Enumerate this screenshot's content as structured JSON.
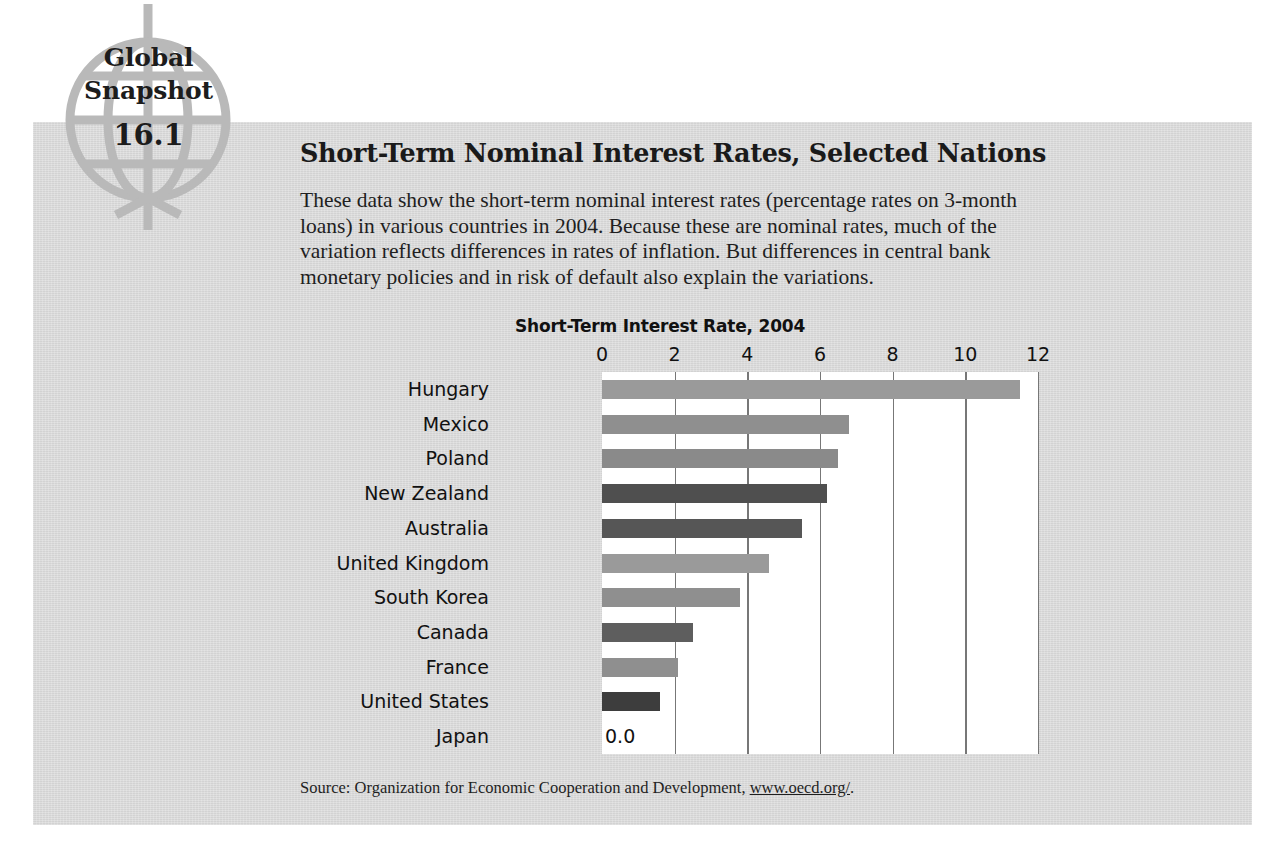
{
  "badge": {
    "line1": "Global",
    "line2": "Snapshot",
    "number": "16.1",
    "icon": "globe-icon"
  },
  "heading": "Short-Term Nominal Interest Rates, Selected Nations",
  "blurb": "These data show the short-term nominal interest rates (percentage rates on 3-month loans) in various countries in 2004. Because these are nominal rates, much of the variation reflects differences in rates of inflation. But differences in central bank monetary policies and in risk of default also explain the variations.",
  "source": {
    "prefix": "Source: Organization for Economic Cooperation and Development, ",
    "link": "www.oecd.org/",
    "suffix": "."
  },
  "colors": {
    "panel_bg": "#d7d7d7",
    "plot_bg": "#ffffff",
    "bar_light": "#9a9a9a",
    "bar_dark": "#4f4f4f",
    "gridline": "#777777",
    "text": "#1a1a1a"
  },
  "chart_data": {
    "type": "bar",
    "orientation": "horizontal",
    "title": "Short-Term Interest Rate, 2004",
    "xlabel": "",
    "ylabel": "",
    "xlim": [
      0,
      12
    ],
    "ticks": [
      "0",
      "2",
      "4",
      "6",
      "8",
      "10",
      "12"
    ],
    "tick_values": [
      0,
      2,
      4,
      6,
      8,
      10,
      12
    ],
    "grid": true,
    "legend": "none",
    "zero_annotation": "0.0",
    "categories": [
      "Hungary",
      "Mexico",
      "Poland",
      "New Zealand",
      "Australia",
      "United Kingdom",
      "South Korea",
      "Canada",
      "France",
      "United States",
      "Japan"
    ],
    "values": [
      11.5,
      6.8,
      6.5,
      6.2,
      5.5,
      4.6,
      3.8,
      2.5,
      2.1,
      1.6,
      0.0
    ],
    "bar_colors": [
      "#9a9a9a",
      "#8f8f8f",
      "#8a8a8a",
      "#4f4f4f",
      "#565656",
      "#9a9a9a",
      "#8f8f8f",
      "#5e5e5e",
      "#8f8f8f",
      "#3d3d3d",
      "#9a9a9a"
    ]
  }
}
